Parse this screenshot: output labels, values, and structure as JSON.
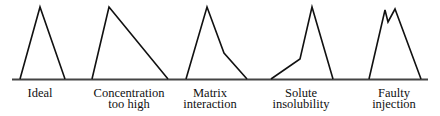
{
  "diagram": {
    "type": "chromatographic peak shapes",
    "baseline": {
      "x1": 12,
      "x2": 428,
      "y": 79.5,
      "color": "#444444",
      "width": 2
    },
    "stroke_color": "#111111",
    "peaks": [
      {
        "id": "ideal",
        "label_lines": [
          "Ideal"
        ],
        "label_x": 40,
        "points": "20,79 40,7 65,79"
      },
      {
        "id": "concentration-too-high",
        "label_lines": [
          "Concentration",
          "too high"
        ],
        "label_x": 129,
        "points": "92,79 109,7 168,79"
      },
      {
        "id": "matrix-interaction",
        "label_lines": [
          "Matrix",
          "interaction"
        ],
        "label_x": 210,
        "points": "186,79 207,7 224,53 247,79"
      },
      {
        "id": "solute-insolubility",
        "label_lines": [
          "Solute",
          "insolubility"
        ],
        "label_x": 301,
        "points": "271,79 300,59 312,7 333,79"
      },
      {
        "id": "faulty-injection",
        "label_lines": [
          "Faulty",
          "injection"
        ],
        "label_x": 394,
        "points": "369,79 385,10 388,22 395,9 421,79"
      }
    ]
  }
}
